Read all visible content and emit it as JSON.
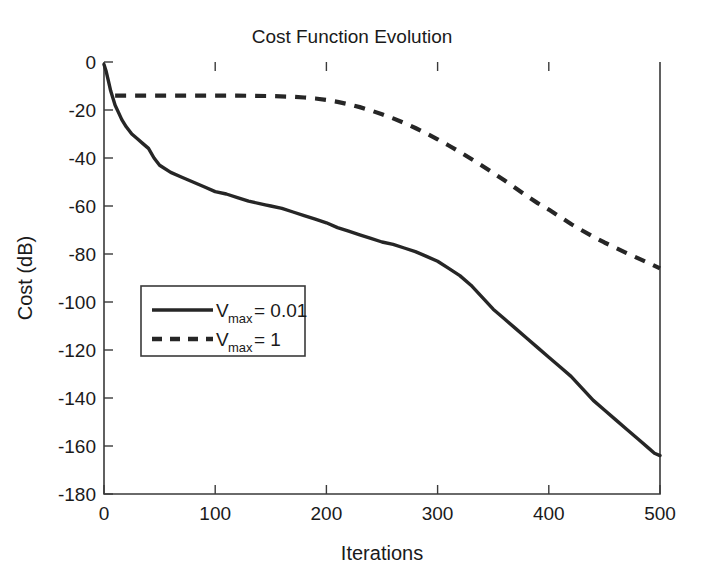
{
  "chart_data": {
    "type": "line",
    "title": "Cost Function Evolution",
    "xlabel": "Iterations",
    "ylabel": "Cost  (dB)",
    "xlim": [
      0,
      500
    ],
    "ylim": [
      -180,
      0
    ],
    "xticks": [
      0,
      100,
      200,
      300,
      400,
      500
    ],
    "yticks": [
      0,
      -20,
      -40,
      -60,
      -80,
      -100,
      -120,
      -140,
      -160,
      -180
    ],
    "xtick_labels": [
      "0",
      "100",
      "200",
      "300",
      "400",
      "500"
    ],
    "ytick_labels": [
      "0",
      "-20",
      "-40",
      "-60",
      "-80",
      "-100",
      "-120",
      "-140",
      "-160",
      "-180"
    ],
    "grid": false,
    "legend_position": "center-left",
    "series": [
      {
        "name": "V_max = 0.01",
        "label_main": "V",
        "label_sub": "max",
        "label_tail": "= 0.01",
        "style": "solid",
        "color": "#262626",
        "x": [
          0,
          2,
          4,
          6,
          8,
          10,
          13,
          16,
          20,
          25,
          30,
          35,
          40,
          45,
          50,
          60,
          70,
          80,
          90,
          100,
          110,
          120,
          130,
          140,
          145,
          150,
          160,
          170,
          180,
          190,
          200,
          210,
          220,
          230,
          240,
          250,
          260,
          270,
          280,
          290,
          300,
          310,
          320,
          330,
          340,
          350,
          360,
          370,
          380,
          390,
          400,
          410,
          420,
          430,
          440,
          450,
          460,
          470,
          480,
          490,
          495,
          500
        ],
        "y": [
          -1,
          -4,
          -8,
          -12,
          -15,
          -18,
          -21,
          -24,
          -27,
          -30,
          -32,
          -34,
          -36,
          -40,
          -43,
          -46,
          -48,
          -50,
          -52,
          -54,
          -55,
          -56.5,
          -58,
          -59,
          -59.5,
          -60,
          -61,
          -62.5,
          -64,
          -65.5,
          -67,
          -69,
          -70.5,
          -72,
          -73.5,
          -75,
          -76,
          -77.5,
          -79,
          -81,
          -83,
          -86,
          -89,
          -93,
          -98,
          -103,
          -107,
          -111,
          -115,
          -119,
          -123,
          -127,
          -131,
          -136,
          -141,
          -145,
          -149,
          -153,
          -157,
          -161,
          -163,
          -164
        ]
      },
      {
        "name": "V_max = 1",
        "label_main": "V",
        "label_sub": "max",
        "label_tail": "= 1",
        "style": "dashed",
        "color": "#262626",
        "x": [
          10,
          30,
          60,
          90,
          120,
          150,
          170,
          180,
          190,
          200,
          210,
          220,
          230,
          240,
          250,
          260,
          270,
          280,
          290,
          300,
          310,
          320,
          330,
          340,
          350,
          360,
          370,
          380,
          390,
          400,
          410,
          420,
          430,
          440,
          450,
          460,
          470,
          480,
          490,
          500
        ],
        "y": [
          -14,
          -14,
          -14,
          -14,
          -14,
          -14.2,
          -14.5,
          -14.8,
          -15.2,
          -15.8,
          -16.6,
          -17.6,
          -18.8,
          -20.2,
          -21.8,
          -23.5,
          -25.4,
          -27.5,
          -29.8,
          -32.2,
          -34.8,
          -37.5,
          -40.3,
          -43.2,
          -46.2,
          -49.3,
          -52.5,
          -55.8,
          -58.8,
          -61.5,
          -64.5,
          -67.5,
          -70.2,
          -72.8,
          -75.2,
          -77.4,
          -79.6,
          -81.7,
          -83.8,
          -86.0
        ]
      }
    ]
  },
  "legend": {
    "entries": [
      {
        "label_main": "V",
        "label_sub": "max",
        "label_tail": "= 0.01",
        "style": "solid"
      },
      {
        "label_main": "V",
        "label_sub": "max",
        "label_tail": "= 1",
        "style": "dashed"
      }
    ]
  }
}
